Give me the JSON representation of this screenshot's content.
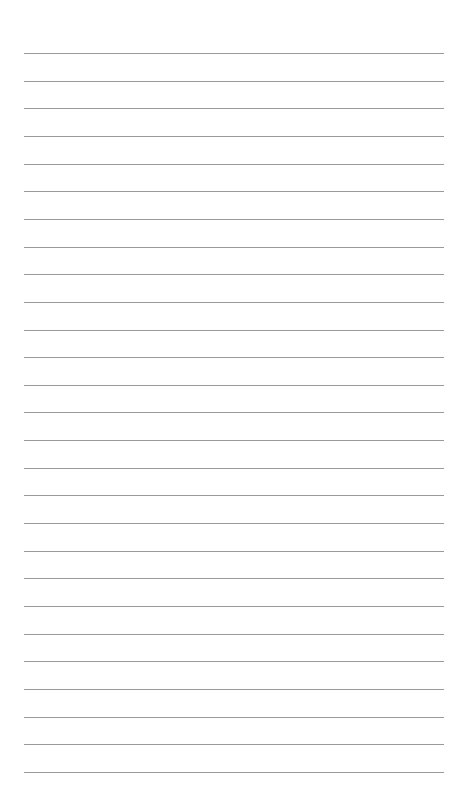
{
  "page": {
    "type": "lined-paper",
    "background_color": "#ffffff",
    "line_color": "#9a9a9a",
    "line_count": 27,
    "first_line_y": 53,
    "line_spacing": 27.65,
    "line_left": 24,
    "line_right": 444
  }
}
